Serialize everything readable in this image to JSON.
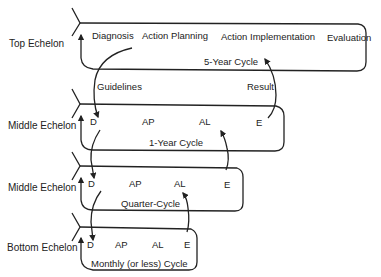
{
  "diagram": {
    "type": "hierarchical-cycle-diagram",
    "echelons": [
      {
        "label": "Top Echelon",
        "steps": [
          "Diagnosis",
          "Action Planning",
          "Action Implementation",
          "Evaluation"
        ],
        "cycle": "5-Year Cycle"
      },
      {
        "label": "Middle Echelon",
        "steps": [
          "D",
          "AP",
          "AL",
          "E"
        ],
        "cycle": "1-Year Cycle"
      },
      {
        "label": "Middle Echelon",
        "steps": [
          "D",
          "AP",
          "AL",
          "E"
        ],
        "cycle": "Quarter-Cycle"
      },
      {
        "label": "Bottom Echelon",
        "steps": [
          "D",
          "AP",
          "AL",
          "E"
        ],
        "cycle": "Monthly (or less) Cycle"
      }
    ],
    "flows": {
      "down": "Guidelines",
      "up": "Result"
    },
    "colors": {
      "line": "#222222",
      "background": "#ffffff"
    }
  }
}
